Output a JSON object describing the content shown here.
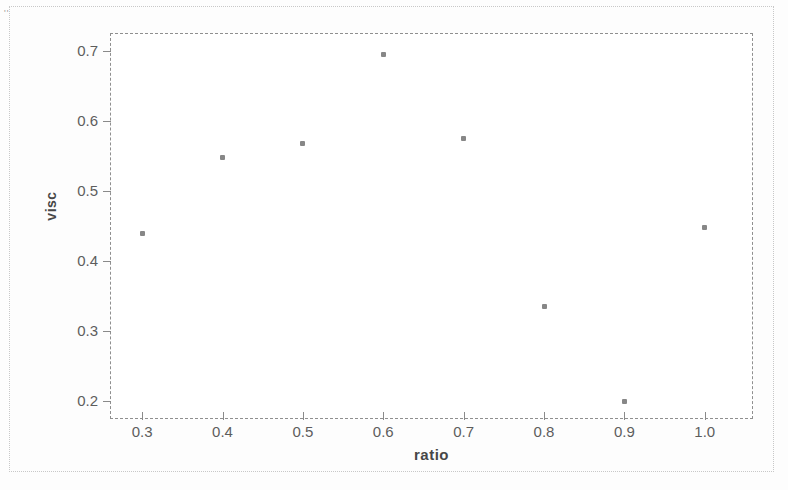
{
  "chart_data": {
    "type": "scatter",
    "title": "",
    "xlabel": "ratio",
    "ylabel": "visc",
    "xlim": [
      0.26,
      1.06
    ],
    "ylim": [
      0.175,
      0.725
    ],
    "grid": false,
    "legend": null,
    "xticks": [
      "0.3",
      "0.4",
      "0.5",
      "0.6",
      "0.7",
      "0.8",
      "0.9",
      "1.0"
    ],
    "xtick_values": [
      0.3,
      0.4,
      0.5,
      0.6,
      0.7,
      0.8,
      0.9,
      1.0
    ],
    "yticks": [
      "0.7",
      "0.6",
      "0.5",
      "0.4",
      "0.3",
      "0.2"
    ],
    "ytick_values": [
      0.7,
      0.6,
      0.5,
      0.4,
      0.3,
      0.2
    ],
    "x": [
      0.3,
      0.4,
      0.5,
      0.6,
      0.7,
      0.8,
      0.9,
      1.0
    ],
    "y": [
      0.44,
      0.548,
      0.567,
      0.695,
      0.574,
      0.336,
      0.2,
      0.448
    ],
    "points": [
      {
        "x": 0.3,
        "y": 0.44
      },
      {
        "x": 0.4,
        "y": 0.548
      },
      {
        "x": 0.5,
        "y": 0.567
      },
      {
        "x": 0.6,
        "y": 0.695
      },
      {
        "x": 0.7,
        "y": 0.574
      },
      {
        "x": 0.8,
        "y": 0.336
      },
      {
        "x": 0.9,
        "y": 0.2
      },
      {
        "x": 1.0,
        "y": 0.448
      }
    ],
    "marker_color": "#6d6d6d",
    "axis_color": "#8a8a8a"
  },
  "page": {
    "speck": "''"
  }
}
